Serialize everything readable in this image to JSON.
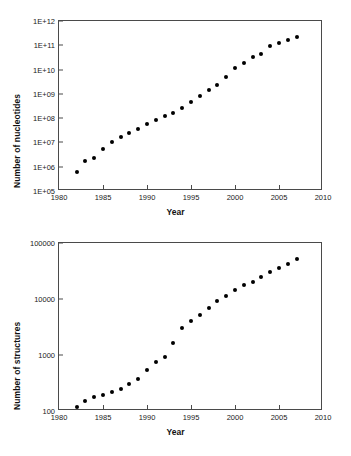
{
  "figure": {
    "background_color": "#ffffff",
    "marker_color": "#000000",
    "axis_color": "#4a4a4a"
  },
  "chart_data": [
    {
      "type": "scatter",
      "panel": "top",
      "title": "",
      "xlabel": "Year",
      "ylabel": "Number of nucleotides",
      "xlim": [
        1980,
        2010
      ],
      "ylim": [
        100000.0,
        1000000000000.0
      ],
      "yscale": "log",
      "grid": false,
      "legend": null,
      "xticks": [
        "1980",
        "1985",
        "1990",
        "1995",
        "2000",
        "2005",
        "2010"
      ],
      "xtick_values": [
        1980,
        1985,
        1990,
        1995,
        2000,
        2005,
        2010
      ],
      "yticks": [
        "1E+05",
        "1E+06",
        "1E+07",
        "1E+08",
        "1E+09",
        "1E+10",
        "1E+11",
        "1E+12"
      ],
      "ytick_values": [
        100000,
        1000000,
        10000000,
        100000000,
        1000000000,
        10000000000,
        100000000000,
        1000000000000
      ],
      "x": [
        1982,
        1983,
        1984,
        1985,
        1986,
        1987,
        1988,
        1989,
        1990,
        1991,
        1992,
        1993,
        1994,
        1995,
        1996,
        1997,
        1998,
        1999,
        2000,
        2001,
        2002,
        2003,
        2004,
        2005,
        2006,
        2007
      ],
      "values": [
        600000,
        1700000,
        2200000,
        5600000,
        10000000,
        16000000,
        25000000,
        36000000,
        57000000,
        82000000,
        125000000,
        170000000,
        250000000,
        470000000,
        800000000,
        1500000000,
        2400000000,
        5000000000,
        12000000000,
        18000000000,
        32000000000,
        42000000000,
        95000000000,
        130000000000,
        170000000000,
        230000000000
      ]
    },
    {
      "type": "scatter",
      "panel": "bottom",
      "title": "",
      "xlabel": "Year",
      "ylabel": "Number of structures",
      "xlim": [
        1980,
        2010
      ],
      "ylim": [
        100,
        100000
      ],
      "yscale": "log",
      "grid": false,
      "legend": null,
      "xticks": [
        "1980",
        "1985",
        "1990",
        "1995",
        "2000",
        "2005",
        "2010"
      ],
      "xtick_values": [
        1980,
        1985,
        1990,
        1995,
        2000,
        2005,
        2010
      ],
      "yticks": [
        "100",
        "1000",
        "10000",
        "100000"
      ],
      "ytick_values": [
        100,
        1000,
        10000,
        100000
      ],
      "x": [
        1982,
        1983,
        1984,
        1985,
        1986,
        1987,
        1988,
        1989,
        1990,
        1991,
        1992,
        1993,
        1994,
        1995,
        1996,
        1997,
        1998,
        1999,
        2000,
        2001,
        2002,
        2003,
        2004,
        2005,
        2006,
        2007
      ],
      "values": [
        120,
        150,
        180,
        195,
        215,
        245,
        300,
        370,
        530,
        740,
        930,
        1650,
        3000,
        4000,
        5200,
        6800,
        9300,
        11500,
        14200,
        17500,
        20500,
        24500,
        30000,
        36000,
        43000,
        51000
      ]
    }
  ]
}
